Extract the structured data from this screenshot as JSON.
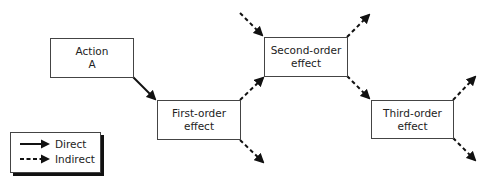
{
  "nodes": [
    {
      "id": "action-a",
      "line1": "Action",
      "line2": "A"
    },
    {
      "id": "first-order",
      "line1": "First-order",
      "line2": "effect"
    },
    {
      "id": "second-order",
      "line1": "Second-order",
      "line2": "effect"
    },
    {
      "id": "third-order",
      "line1": "Third-order",
      "line2": "effect"
    }
  ],
  "edges": [
    {
      "from": "action-a",
      "to": "first-order",
      "type": "direct"
    },
    {
      "from": "first-order",
      "to": "second-order",
      "type": "indirect"
    },
    {
      "from": "second-order",
      "to": "third-order",
      "type": "indirect"
    },
    {
      "from": "external",
      "to": "second-order",
      "type": "indirect"
    },
    {
      "from": "first-order",
      "to": "external",
      "type": "indirect"
    },
    {
      "from": "second-order",
      "to": "external",
      "type": "indirect"
    },
    {
      "from": "third-order",
      "to": "external-up",
      "type": "indirect"
    },
    {
      "from": "third-order",
      "to": "external-down",
      "type": "indirect"
    }
  ],
  "legend": {
    "direct_label": "Direct",
    "indirect_label": "Indirect"
  },
  "colors": {
    "line": "#111111",
    "border": "#444444"
  }
}
